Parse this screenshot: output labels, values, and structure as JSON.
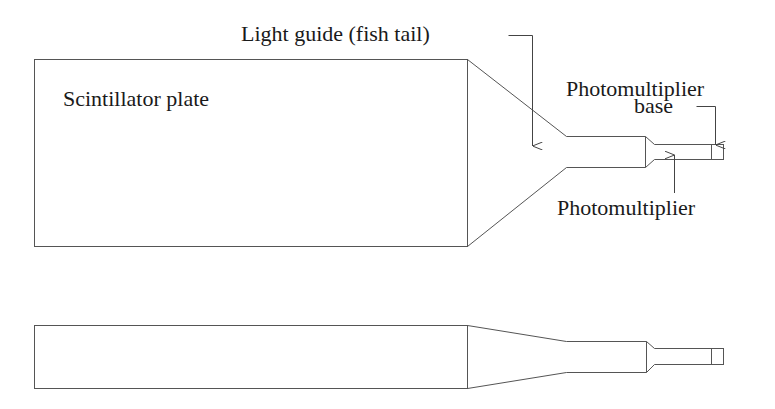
{
  "diagram": {
    "views": [
      "top view",
      "side view"
    ],
    "labels": {
      "scintillator": "Scintillator plate",
      "light_guide": "Light guide (fish tail)",
      "pmt_base_line1": "Photomultiplier",
      "pmt_base_line2": "base",
      "pmt": "Photomultiplier"
    },
    "colors": {
      "stroke": "#555555",
      "text": "#1a1a1a",
      "background": "#ffffff"
    }
  }
}
